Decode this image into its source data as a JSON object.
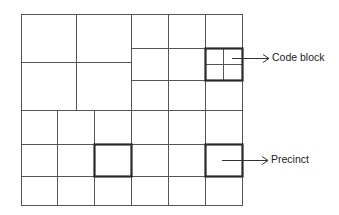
{
  "diagram": {
    "type": "jpeg2000-tile-partition",
    "colors": {
      "thin_line": "#555555",
      "thick_line": "#2a2a2a",
      "background": "#ffffff",
      "text": "#222222"
    },
    "labels": {
      "code_block": "Code block",
      "precinct": "Precinct"
    },
    "outer_frame": {
      "x1": 21,
      "y1": 14,
      "x2": 242,
      "y2": 205
    },
    "thin_lines": [
      {
        "x1": 76,
        "y1": 14,
        "x2": 76,
        "y2": 110
      },
      {
        "x1": 21,
        "y1": 62,
        "x2": 131,
        "y2": 62
      },
      {
        "x1": 131,
        "y1": 14,
        "x2": 131,
        "y2": 205
      },
      {
        "x1": 168,
        "y1": 14,
        "x2": 168,
        "y2": 205
      },
      {
        "x1": 205,
        "y1": 14,
        "x2": 205,
        "y2": 205
      },
      {
        "x1": 131,
        "y1": 48,
        "x2": 242,
        "y2": 48
      },
      {
        "x1": 131,
        "y1": 80,
        "x2": 242,
        "y2": 80
      },
      {
        "x1": 21,
        "y1": 110,
        "x2": 242,
        "y2": 110
      },
      {
        "x1": 21,
        "y1": 144,
        "x2": 242,
        "y2": 144
      },
      {
        "x1": 21,
        "y1": 176,
        "x2": 242,
        "y2": 176
      },
      {
        "x1": 57,
        "y1": 110,
        "x2": 57,
        "y2": 205
      },
      {
        "x1": 94,
        "y1": 110,
        "x2": 94,
        "y2": 205
      },
      {
        "x1": 223,
        "y1": 48,
        "x2": 223,
        "y2": 80
      },
      {
        "x1": 205,
        "y1": 64,
        "x2": 242,
        "y2": 64
      }
    ],
    "highlight_boxes": [
      {
        "name": "code-block-precinct-box",
        "x": 205,
        "y": 48,
        "w": 37,
        "h": 32
      },
      {
        "name": "precinct-box-left",
        "x": 94,
        "y": 144,
        "w": 37,
        "h": 32
      },
      {
        "name": "precinct-box-right",
        "x": 205,
        "y": 144,
        "w": 37,
        "h": 32
      }
    ],
    "arrows": [
      {
        "name": "code-block-arrow",
        "x1": 232,
        "y1": 58,
        "x2": 269,
        "y2": 58
      },
      {
        "name": "precinct-arrow",
        "x1": 222,
        "y1": 160,
        "x2": 268,
        "y2": 160
      }
    ]
  }
}
